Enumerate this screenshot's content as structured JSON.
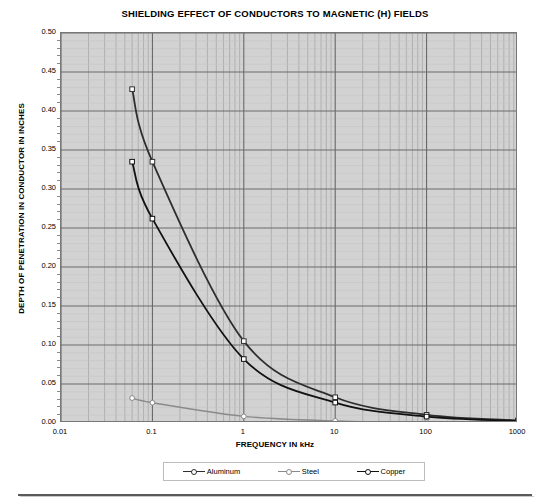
{
  "chart_data": {
    "type": "line",
    "title": "SHIELDING EFFECT OF CONDUCTORS TO MAGNETIC (H) FIELDS",
    "xlabel": "FREQUENCY IN kHz",
    "ylabel": "DEPTH OF PENETRATION IN CONDUCTOR IN INCHES",
    "xscale": "log",
    "yscale": "linear",
    "xlim": [
      0.01,
      1000
    ],
    "ylim": [
      0.0,
      0.5
    ],
    "x_tick_labels": [
      "0.01",
      "0.1",
      "1",
      "10",
      "100",
      "1000"
    ],
    "x_ticks": [
      0.01,
      0.1,
      1,
      10,
      100,
      1000
    ],
    "y_tick_labels": [
      "0.00",
      "0.05",
      "0.10",
      "0.15",
      "0.20",
      "0.25",
      "0.30",
      "0.35",
      "0.40",
      "0.45",
      "0.50"
    ],
    "y_ticks": [
      0.0,
      0.05,
      0.1,
      0.15,
      0.2,
      0.25,
      0.3,
      0.35,
      0.4,
      0.45,
      0.5
    ],
    "grid": true,
    "minor_grid": true,
    "legend_position": "bottom",
    "plot_bgcolor": "#d2d2d2",
    "series": [
      {
        "name": "Aluminum",
        "color": "#2e2e2e",
        "marker": "open-square",
        "x": [
          0.06,
          0.1,
          1,
          10,
          100,
          1000
        ],
        "y": [
          0.428,
          0.335,
          0.105,
          0.033,
          0.0105,
          0.0033
        ]
      },
      {
        "name": "Steel",
        "color": "#8a8a8a",
        "marker": "open-circle",
        "x": [
          0.06,
          0.1,
          1,
          10,
          100,
          1000
        ],
        "y": [
          0.032,
          0.026,
          0.0085,
          0.0027,
          0.00085,
          0.00027
        ]
      },
      {
        "name": "Copper",
        "color": "#111111",
        "marker": "open-square",
        "x": [
          0.06,
          0.1,
          1,
          10,
          100,
          1000
        ],
        "y": [
          0.335,
          0.262,
          0.082,
          0.0262,
          0.0082,
          0.0026
        ]
      }
    ]
  }
}
